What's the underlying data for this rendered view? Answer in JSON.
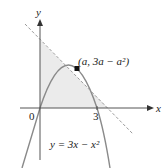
{
  "figure": {
    "axes": {
      "x_label": "x",
      "y_label": "y",
      "origin_label": "0",
      "x_tick_label": "3"
    },
    "point_label": "(a, 3a − a²)",
    "curve_label": "y = 3x − x²",
    "colors": {
      "shade": "#ebebeb",
      "curve": "#8a8a8a",
      "tangent": "#9a9a9a",
      "axis": "#555555",
      "point": "#111111"
    }
  }
}
